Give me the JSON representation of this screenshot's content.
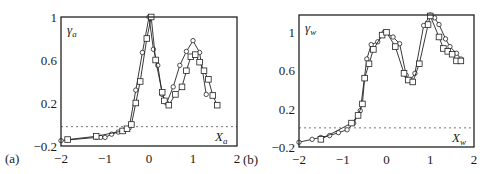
{
  "chart_data": [
    {
      "type": "line",
      "panel_label": "(a)",
      "ylabel": "γ",
      "ylabel_sub": "a",
      "xlabel": "X",
      "xlabel_sub": "a",
      "xlim": [
        -2,
        2
      ],
      "ylim": [
        -0.2,
        1.0
      ],
      "xticks": [
        -2,
        -1,
        0,
        1,
        2
      ],
      "xtick_labels": [
        "−2",
        "−1",
        "0",
        "1",
        "2"
      ],
      "yticks": [
        1,
        0.6,
        0.2,
        -0.2
      ],
      "ytick_labels": [
        "1",
        "0.6",
        "0.2",
        "−0.2"
      ],
      "reference_line": {
        "y": -0.02,
        "style": "dashed"
      },
      "grid": false,
      "series": [
        {
          "name": "circles",
          "marker": "circle",
          "x": [
            -2.0,
            -1.2,
            -1.1,
            -1.0,
            -0.85,
            -0.7,
            -0.55,
            -0.45,
            -0.3,
            -0.15,
            0.0,
            0.1,
            0.2,
            0.3,
            0.4,
            0.55,
            0.7,
            0.85,
            1.0,
            1.15,
            1.3
          ],
          "y": [
            -0.15,
            -0.12,
            -0.12,
            -0.12,
            -0.09,
            -0.07,
            -0.05,
            -0.03,
            0.32,
            0.67,
            1.0,
            0.7,
            0.55,
            0.28,
            0.2,
            0.35,
            0.55,
            0.68,
            0.78,
            0.67,
            0.28
          ]
        },
        {
          "name": "squares",
          "marker": "square",
          "x": [
            -1.85,
            -1.2,
            -0.6,
            -0.5,
            -0.4,
            -0.3,
            -0.2,
            -0.05,
            0.05,
            0.15,
            0.3,
            0.35,
            0.45,
            0.6,
            0.75,
            0.85,
            0.95,
            1.05,
            1.15,
            1.25,
            1.35,
            1.45,
            1.55
          ],
          "y": [
            -0.14,
            -0.11,
            -0.06,
            -0.04,
            0.0,
            0.2,
            0.4,
            0.8,
            1.0,
            0.6,
            0.3,
            0.22,
            0.18,
            0.28,
            0.35,
            0.5,
            0.63,
            0.65,
            0.58,
            0.5,
            0.42,
            0.27,
            0.18
          ]
        }
      ],
      "frame_px": {
        "left": 61,
        "top": 17,
        "right": 237,
        "bottom": 146
      },
      "ytop_value": 1.0
    },
    {
      "type": "line",
      "panel_label": "(b)",
      "ylabel": "γ",
      "ylabel_sub": "w",
      "xlabel": "X",
      "xlabel_sub": "w",
      "xlim": [
        -2,
        2
      ],
      "ylim": [
        -0.2,
        1.18
      ],
      "xticks": [
        -2,
        -1,
        0,
        1,
        2
      ],
      "xtick_labels": [
        "−2",
        "−1",
        "0",
        "1",
        "2"
      ],
      "yticks": [
        1,
        0.6,
        0.2,
        -0.2
      ],
      "ytick_labels": [
        "1",
        "0.6",
        "0.2",
        "−0.2"
      ],
      "reference_line": {
        "y": 0.0,
        "style": "dashed"
      },
      "grid": false,
      "series": [
        {
          "name": "circles",
          "marker": "circle",
          "x": [
            -2.0,
            -1.7,
            -1.5,
            -1.3,
            -1.1,
            -0.9,
            -0.75,
            -0.6,
            -0.45,
            -0.35,
            -0.2,
            -0.05,
            0.15,
            0.3,
            0.45,
            0.55,
            0.65,
            0.85,
            1.0,
            1.1,
            1.2,
            1.35,
            1.45,
            1.6,
            1.7
          ],
          "y": [
            -0.15,
            -0.12,
            -0.1,
            -0.08,
            -0.05,
            -0.02,
            0.05,
            0.18,
            0.72,
            0.87,
            0.9,
            1.0,
            0.95,
            0.88,
            0.55,
            0.5,
            0.57,
            1.07,
            1.18,
            1.15,
            1.08,
            0.93,
            0.85,
            0.78,
            0.72
          ]
        },
        {
          "name": "squares",
          "marker": "square",
          "x": [
            -1.5,
            -0.8,
            -0.65,
            -0.55,
            -0.5,
            -0.4,
            -0.3,
            -0.1,
            0.0,
            0.2,
            0.4,
            0.5,
            0.6,
            0.75,
            0.95,
            1.0,
            1.2,
            1.3,
            1.4,
            1.5,
            1.6,
            1.7
          ],
          "y": [
            -0.12,
            0.05,
            0.13,
            0.25,
            0.52,
            0.67,
            0.82,
            0.97,
            1.0,
            0.85,
            0.57,
            0.5,
            0.48,
            0.67,
            1.08,
            1.17,
            0.95,
            0.83,
            0.8,
            0.77,
            0.7,
            0.7
          ]
        }
      ],
      "frame_px": {
        "left": 299,
        "top": 15,
        "right": 474,
        "bottom": 147
      },
      "ytop_value": 1.18
    }
  ]
}
